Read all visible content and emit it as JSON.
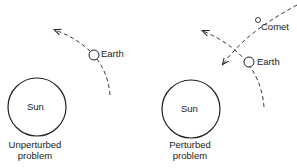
{
  "panels": [
    {
      "id": "unperturbed",
      "sun_label": "Sun",
      "body_label": "Earth",
      "caption_line1": "Unperturbed",
      "caption_line2": "problem"
    },
    {
      "id": "perturbed",
      "sun_label": "Sun",
      "body_label": "Earth",
      "comet_label": "Comet",
      "caption_line1": "Perturbed",
      "caption_line2": "problem"
    }
  ],
  "colors": {
    "ink": "#222222",
    "background": "#ffffff"
  }
}
